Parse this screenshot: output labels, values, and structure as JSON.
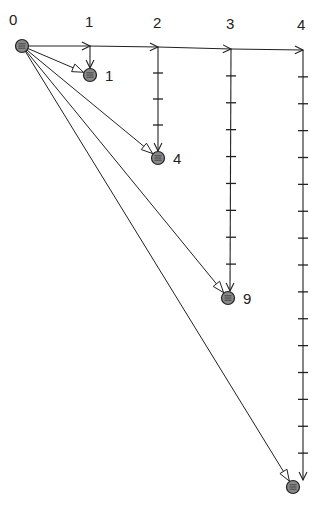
{
  "diagram": {
    "origin": {
      "x": 22,
      "y": 46,
      "label": "0"
    },
    "top_labels": [
      {
        "text": "0",
        "x": 9,
        "y": 12
      },
      {
        "text": "1",
        "x": 85,
        "y": 14
      },
      {
        "text": "2",
        "x": 153,
        "y": 15
      },
      {
        "text": "3",
        "x": 226,
        "y": 16
      },
      {
        "text": "4",
        "x": 297,
        "y": 17
      }
    ],
    "columns": [
      {
        "x": 90,
        "top": 46,
        "bottom": 75,
        "ticks": 0
      },
      {
        "x": 158,
        "top": 47,
        "bottom": 158,
        "ticks": 3
      },
      {
        "x": 231,
        "top": 49,
        "bottom": 298,
        "ticks": 8
      },
      {
        "x": 303,
        "top": 50,
        "bottom": 487,
        "ticks": 15
      }
    ],
    "points": [
      {
        "x": 90,
        "y": 75,
        "label": "1"
      },
      {
        "x": 158,
        "y": 158,
        "label": "4"
      },
      {
        "x": 228,
        "y": 298,
        "label": "9"
      },
      {
        "x": 293,
        "y": 487,
        "label": ""
      }
    ],
    "colors": {
      "stroke": "#222222",
      "point_fill": "#888888"
    }
  }
}
